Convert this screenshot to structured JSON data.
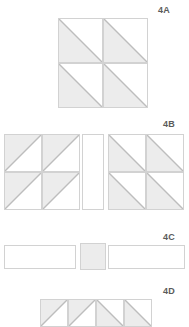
{
  "document": {
    "title": "Quilt block piecing diagrams",
    "background_color": "#ffffff",
    "line_color": "#d2d2d2",
    "fill_color": "#ececec",
    "label_color": "#5b5b5b"
  },
  "blocks": [
    {
      "id": "4A",
      "label": "4A",
      "label_x": 158,
      "label_y": 5,
      "description": "two by two grid of half square triangle units",
      "x": 58,
      "y": 18,
      "cols": 2,
      "rows": 2,
      "cell_size": 45,
      "cells": [
        {
          "name": "cell-r1c1",
          "col": 0,
          "row": 0,
          "diagonal": "backslash",
          "shaded_half": "lower-left"
        },
        {
          "name": "cell-r1c2",
          "col": 1,
          "row": 0,
          "diagonal": "backslash",
          "shaded_half": "lower-left"
        },
        {
          "name": "cell-r2c1",
          "col": 0,
          "row": 1,
          "diagonal": "backslash",
          "shaded_half": "lower-left"
        },
        {
          "name": "cell-r2c2",
          "col": 1,
          "row": 1,
          "diagonal": "backslash",
          "shaded_half": "lower-left"
        }
      ]
    },
    {
      "id": "4B",
      "label": "4B",
      "label_x": 163,
      "label_y": 119,
      "description": "two pinwheel blocks separated by a plain sashing strip",
      "units": [
        {
          "name": "pinwheel-left",
          "x": 4,
          "y": 134,
          "cols": 2,
          "rows": 2,
          "cell_size": 38,
          "cells": [
            {
              "name": "cell-r1c1",
              "col": 0,
              "row": 0,
              "diagonal": "slash",
              "shaded_half": "lower-left"
            },
            {
              "name": "cell-r1c2",
              "col": 1,
              "row": 0,
              "diagonal": "slash",
              "shaded_half": "lower-left"
            },
            {
              "name": "cell-r2c1",
              "col": 0,
              "row": 1,
              "diagonal": "slash",
              "shaded_half": "lower-left"
            },
            {
              "name": "cell-r2c2",
              "col": 1,
              "row": 1,
              "diagonal": "slash",
              "shaded_half": "lower-left"
            }
          ]
        },
        {
          "name": "sashing-strip",
          "x": 82,
          "y": 134,
          "width": 22,
          "height": 76,
          "fill": "plain"
        },
        {
          "name": "pinwheel-right",
          "x": 108,
          "y": 134,
          "cols": 2,
          "rows": 2,
          "cell_size": 38,
          "cells": [
            {
              "name": "cell-r1c1",
              "col": 0,
              "row": 0,
              "diagonal": "backslash",
              "shaded_half": "lower-left"
            },
            {
              "name": "cell-r1c2",
              "col": 1,
              "row": 0,
              "diagonal": "backslash",
              "shaded_half": "lower-left"
            },
            {
              "name": "cell-r2c1",
              "col": 0,
              "row": 1,
              "diagonal": "backslash",
              "shaded_half": "lower-left"
            },
            {
              "name": "cell-r2c2",
              "col": 1,
              "row": 1,
              "diagonal": "backslash",
              "shaded_half": "lower-left"
            }
          ]
        }
      ]
    },
    {
      "id": "4C",
      "label": "4C",
      "label_x": 163,
      "label_y": 232,
      "description": "row of two long plain strips with a small shaded square between them",
      "pieces": [
        {
          "name": "strip-left",
          "x": 4,
          "y": 245,
          "width": 72,
          "height": 24,
          "fill": "plain"
        },
        {
          "name": "center-square",
          "x": 80,
          "y": 243,
          "width": 26,
          "height": 27,
          "fill": "shaded"
        },
        {
          "name": "strip-right",
          "x": 108,
          "y": 245,
          "width": 77,
          "height": 24,
          "fill": "plain"
        }
      ]
    },
    {
      "id": "4D",
      "label": "4D",
      "label_x": 163,
      "label_y": 286,
      "description": "row of four half square triangle units cropped at the page edge",
      "x": 40,
      "y": 299,
      "cell_size": 28,
      "cell_height": 19,
      "cells": [
        {
          "name": "cell-1",
          "index": 0,
          "diagonal": "slash",
          "shaded_half": "lower-left"
        },
        {
          "name": "cell-2",
          "index": 1,
          "diagonal": "slash",
          "shaded_half": "lower-left"
        },
        {
          "name": "cell-3",
          "index": 2,
          "diagonal": "backslash",
          "shaded_half": "lower-left"
        },
        {
          "name": "cell-4",
          "index": 3,
          "diagonal": "backslash",
          "shaded_half": "lower-left"
        }
      ]
    }
  ]
}
